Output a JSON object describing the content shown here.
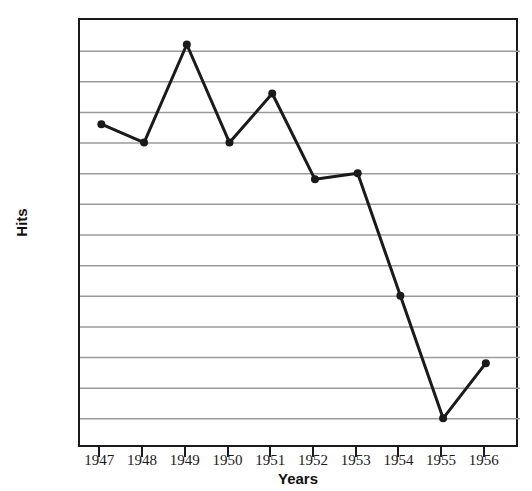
{
  "chart_data": {
    "type": "line",
    "title": "",
    "xlabel": "Years",
    "ylabel": "Hits",
    "categories": [
      "1947",
      "1948",
      "1949",
      "1950",
      "1951",
      "1952",
      "1953",
      "1954",
      "1955",
      "1956"
    ],
    "values": [
      176,
      170,
      202,
      170,
      186,
      158,
      160,
      120,
      80,
      98
    ],
    "x": [
      1947,
      1948,
      1949,
      1950,
      1951,
      1952,
      1953,
      1954,
      1955,
      1956
    ],
    "xlim": [
      1946.5,
      1956.8
    ],
    "ylim": [
      70,
      210
    ],
    "ytick_labels": [
      "210",
      "200",
      "190",
      "180",
      "170",
      "160",
      "150",
      "140",
      "130",
      "120",
      "110",
      "100",
      "90",
      "80",
      "70"
    ],
    "ytick_values": [
      210,
      200,
      190,
      180,
      170,
      160,
      150,
      140,
      130,
      120,
      110,
      100,
      90,
      80,
      70
    ],
    "yminor_values": [
      205,
      195,
      185,
      175,
      165,
      155,
      145,
      135,
      125,
      115,
      105,
      95,
      85,
      75
    ],
    "xtick_labels": [
      "1947",
      "1948",
      "1949",
      "1950",
      "1951",
      "1952",
      "1953",
      "1954",
      "1955",
      "1956"
    ],
    "grid": "horizontal",
    "grid_color": "#9a9a9a",
    "legend": "none",
    "series_color": "#1a1a1a",
    "marker": "circle",
    "marker_size": 8,
    "line_width": 3
  },
  "axes": {
    "frame_color": "#1a1a1a",
    "background": "#ffffff"
  }
}
